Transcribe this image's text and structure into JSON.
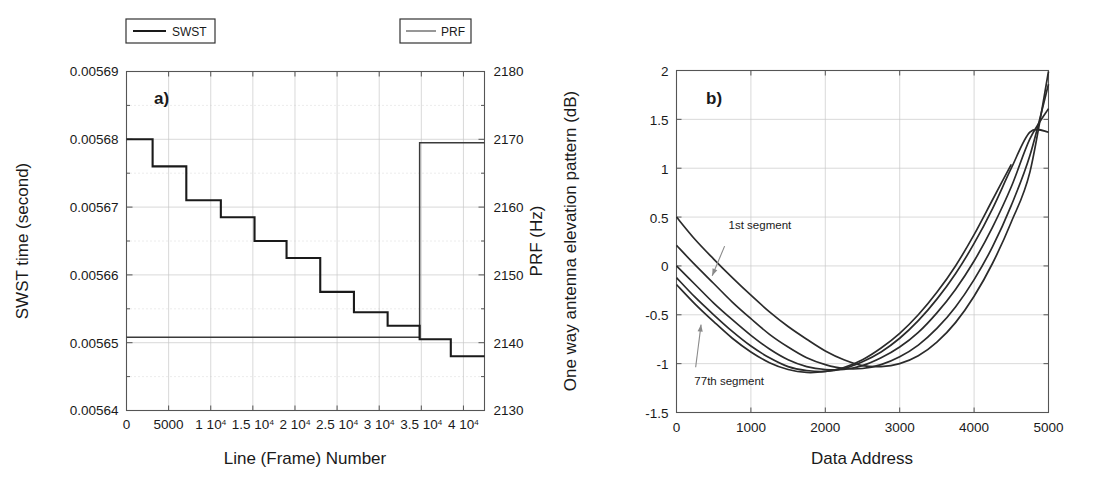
{
  "figure": {
    "panels": [
      {
        "id": "a",
        "label": "a)",
        "legend": [
          {
            "name": "swst",
            "label": "SWST",
            "style": "thick"
          },
          {
            "name": "prf",
            "label": "PRF",
            "style": "thin"
          }
        ]
      },
      {
        "id": "b",
        "label": "b)"
      }
    ]
  },
  "chart_data": [
    {
      "type": "line",
      "panel": "a",
      "title": "",
      "xlabel": "Line (Frame) Number",
      "ylabel": "SWST time (second)",
      "ylabel_right": "PRF (Hz)",
      "xlim": [
        0,
        42500
      ],
      "ylim": [
        0.00564,
        0.00569
      ],
      "ylim_right": [
        2130,
        2180
      ],
      "xticks": [
        0,
        5000,
        10000,
        15000,
        20000,
        25000,
        30000,
        35000,
        40000
      ],
      "xticklabels": [
        "0",
        "5000",
        "1 10",
        "1.5 10",
        "2 10",
        "2.5 10",
        "3 10",
        "3.5 10",
        "4 10"
      ],
      "xticklabels_exp": [
        "",
        "",
        "4",
        "4",
        "4",
        "4",
        "4",
        "4",
        "4"
      ],
      "yticks": [
        0.00564,
        0.00565,
        0.00566,
        0.00567,
        0.00568,
        0.00569
      ],
      "yticklabels": [
        "0.00564",
        "0.00565",
        "0.00566",
        "0.00567",
        "0.00568",
        "0.00569"
      ],
      "yticks_right": [
        2130,
        2140,
        2150,
        2160,
        2170,
        2180
      ],
      "yticklabels_right": [
        "2130",
        "2140",
        "2150",
        "2160",
        "2170",
        "2180"
      ],
      "grid": true,
      "legend_position": "above-plot",
      "series": [
        {
          "name": "SWST",
          "axis": "left",
          "kind": "step",
          "x": [
            0,
            3100,
            7100,
            11200,
            15200,
            19000,
            23000,
            27000,
            31000,
            34800,
            38500,
            42500
          ],
          "values": [
            0.00568,
            0.005676,
            0.005671,
            0.0056685,
            0.005665,
            0.0056625,
            0.0056575,
            0.0056545,
            0.0056525,
            0.0056505,
            0.005648,
            0.005648
          ]
        },
        {
          "name": "PRF",
          "axis": "right",
          "kind": "step",
          "x": [
            0,
            34800,
            42500
          ],
          "values": [
            2140.8,
            2169.5,
            2169.5
          ]
        }
      ]
    },
    {
      "type": "line",
      "panel": "b",
      "title": "",
      "xlabel": "Data Address",
      "ylabel": "One way antenna elevation pattern (dB)",
      "xlim": [
        0,
        5000
      ],
      "ylim": [
        -1.5,
        2
      ],
      "xticks": [
        0,
        1000,
        2000,
        3000,
        4000,
        5000
      ],
      "xticklabels": [
        "0",
        "1000",
        "2000",
        "3000",
        "4000",
        "5000"
      ],
      "yticks": [
        -1.5,
        -1,
        -0.5,
        0,
        0.5,
        1,
        1.5,
        2
      ],
      "yticklabels": [
        "-1.5",
        "-1",
        "-0.5",
        "0",
        "0.5",
        "1",
        "1.5",
        "2"
      ],
      "grid": true,
      "annotations": [
        {
          "name": "first-segment",
          "text": "1st segment",
          "x": 700,
          "y": 0.38,
          "arrow_to_x": 480,
          "arrow_to_y": -0.1
        },
        {
          "name": "last-segment",
          "text": "77th segment",
          "x": 240,
          "y": -1.22,
          "arrow_to_x": 330,
          "arrow_to_y": -0.6
        }
      ],
      "series": [
        {
          "name": "segment-1",
          "x": [
            0,
            250,
            500,
            750,
            1000,
            1250,
            1500,
            1750,
            2000,
            2250,
            2500,
            2750,
            3000,
            3250,
            3500,
            3750,
            4000,
            4250,
            4500,
            4750,
            5000
          ],
          "values": [
            0.5,
            0.27,
            0.07,
            -0.12,
            -0.3,
            -0.47,
            -0.62,
            -0.75,
            -0.87,
            -0.96,
            -1.02,
            -1.03,
            -1.0,
            -0.92,
            -0.78,
            -0.58,
            -0.31,
            0.03,
            0.45,
            0.96,
            1.99
          ]
        },
        {
          "name": "segment-2",
          "x": [
            0,
            250,
            500,
            750,
            1000,
            1250,
            1500,
            1750,
            2000,
            2250,
            2500,
            2750,
            3000,
            3250,
            3500,
            3750,
            4000,
            4250,
            4500,
            4750,
            5000
          ],
          "values": [
            0.21,
            0.01,
            -0.18,
            -0.37,
            -0.54,
            -0.7,
            -0.83,
            -0.94,
            -1.01,
            -1.05,
            -1.05,
            -1.01,
            -0.93,
            -0.81,
            -0.64,
            -0.42,
            -0.14,
            0.2,
            0.62,
            1.13,
            1.86
          ]
        },
        {
          "name": "segment-3",
          "x": [
            0,
            250,
            500,
            750,
            1000,
            1250,
            1500,
            1750,
            2000,
            2250,
            2500,
            2750,
            3000,
            3250,
            3500,
            3750,
            4000,
            4250,
            4500,
            4750,
            5000
          ],
          "values": [
            0.0,
            -0.19,
            -0.38,
            -0.55,
            -0.71,
            -0.85,
            -0.96,
            -1.03,
            -1.06,
            -1.06,
            -1.02,
            -0.94,
            -0.83,
            -0.68,
            -0.48,
            -0.24,
            0.05,
            0.4,
            0.81,
            1.3,
            1.61
          ]
        },
        {
          "name": "segment-4",
          "x": [
            0,
            250,
            500,
            750,
            1000,
            1250,
            1500,
            1750,
            2000,
            2250,
            2500,
            2750,
            3000,
            3250,
            3500,
            3750,
            4000,
            4250,
            4500,
            4750,
            5000
          ],
          "values": [
            -0.12,
            -0.32,
            -0.5,
            -0.67,
            -0.82,
            -0.94,
            -1.03,
            -1.07,
            -1.08,
            -1.05,
            -0.98,
            -0.88,
            -0.74,
            -0.56,
            -0.34,
            -0.08,
            0.23,
            0.59,
            1.0,
            1.37,
            1.37
          ]
        },
        {
          "name": "segment-77",
          "x": [
            0,
            250,
            500,
            750,
            1000,
            1250,
            1500,
            1750,
            2000,
            2250,
            2500,
            2750,
            3000,
            3250,
            3500,
            3750,
            4000,
            4250,
            4500
          ],
          "values": [
            -0.19,
            -0.39,
            -0.57,
            -0.74,
            -0.88,
            -0.99,
            -1.06,
            -1.09,
            -1.08,
            -1.04,
            -0.96,
            -0.84,
            -0.69,
            -0.5,
            -0.27,
            0.0,
            0.32,
            0.68,
            1.04
          ]
        }
      ]
    }
  ]
}
